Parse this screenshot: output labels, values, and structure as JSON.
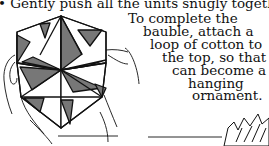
{
  "instructions": {
    "step_text": "• Gently push all the units snugly together.",
    "completion_lines": [
      "To complete the",
      "bauble, attach a",
      "loop of cotton to",
      "the top, so that it",
      "can become a",
      "hanging",
      "ornament."
    ]
  },
  "illustration": {
    "subject": "hands holding folded origami hexagonal bauble",
    "colors": {
      "shaded": "#777777",
      "light": "#ffffff",
      "outline": "#111111"
    }
  }
}
